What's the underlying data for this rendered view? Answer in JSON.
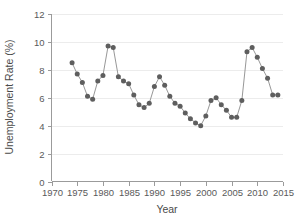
{
  "chart_data": {
    "type": "line",
    "title": "",
    "xlabel": "Year",
    "ylabel": "Unemployment Rate (%)",
    "xlim": [
      1970,
      2015
    ],
    "ylim": [
      0,
      12
    ],
    "xticks": [
      1970,
      1975,
      1980,
      1985,
      1990,
      1995,
      2000,
      2005,
      2010,
      2015
    ],
    "yticks": [
      0,
      2,
      4,
      6,
      8,
      10,
      12
    ],
    "grid": "horizontal",
    "legend": "none",
    "marker": "filled-circle",
    "marker_color": "#5e5e5e",
    "line_color": "#8b8b8b",
    "x": [
      1974,
      1975,
      1976,
      1977,
      1978,
      1979,
      1980,
      1981,
      1982,
      1983,
      1984,
      1985,
      1986,
      1987,
      1988,
      1989,
      1990,
      1991,
      1992,
      1993,
      1994,
      1995,
      1996,
      1997,
      1998,
      1999,
      2000,
      2001,
      2002,
      2003,
      2004,
      2005,
      2006,
      2007,
      2008,
      2009,
      2010,
      2011,
      2012,
      2013,
      2014
    ],
    "values": [
      8.5,
      7.7,
      7.1,
      6.1,
      5.9,
      7.2,
      7.6,
      9.7,
      9.6,
      7.5,
      7.2,
      7.0,
      6.2,
      5.5,
      5.3,
      5.6,
      6.8,
      7.5,
      6.9,
      6.1,
      5.6,
      5.4,
      4.9,
      4.5,
      4.2,
      4.0,
      4.7,
      5.8,
      6.0,
      5.5,
      5.1,
      4.6,
      4.6,
      5.8,
      9.3,
      9.6,
      8.9,
      8.1,
      7.4,
      6.2,
      6.2
    ],
    "point_count": 41
  },
  "axes": {
    "y_axis_title": "Unemployment Rate (%)",
    "x_axis_title": "Year",
    "y_tick_labels": [
      "0",
      "2",
      "4",
      "6",
      "8",
      "10",
      "12"
    ],
    "x_tick_labels": [
      "1970",
      "1975",
      "1980",
      "1985",
      "1990",
      "1995",
      "2000",
      "2005",
      "2010",
      "2015"
    ]
  },
  "colors": {
    "marker": "#5e5e5e",
    "line": "#8b8b8b",
    "axis": "#9b9b9b",
    "grid": "#ececec",
    "text": "#4a4a4a",
    "background": "#ffffff"
  }
}
